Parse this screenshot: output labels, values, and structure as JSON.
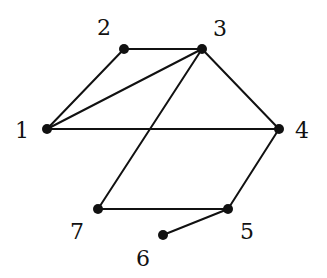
{
  "graph": {
    "nodes": [
      {
        "id": "1",
        "label": "1",
        "x": 47,
        "y": 129,
        "lx": 22,
        "ly": 138
      },
      {
        "id": "2",
        "label": "2",
        "x": 124,
        "y": 49,
        "lx": 104,
        "ly": 35
      },
      {
        "id": "3",
        "label": "3",
        "x": 202,
        "y": 49,
        "lx": 220,
        "ly": 36
      },
      {
        "id": "4",
        "label": "4",
        "x": 279,
        "y": 129,
        "lx": 302,
        "ly": 138
      },
      {
        "id": "5",
        "label": "5",
        "x": 228,
        "y": 209,
        "lx": 247,
        "ly": 239
      },
      {
        "id": "6",
        "label": "6",
        "x": 163,
        "y": 235,
        "lx": 143,
        "ly": 266
      },
      {
        "id": "7",
        "label": "7",
        "x": 98,
        "y": 209,
        "lx": 77,
        "ly": 239
      }
    ],
    "edges": [
      [
        "2",
        "3"
      ],
      [
        "1",
        "2"
      ],
      [
        "1",
        "3"
      ],
      [
        "3",
        "4"
      ],
      [
        "1",
        "4"
      ],
      [
        "3",
        "7"
      ],
      [
        "4",
        "5"
      ],
      [
        "7",
        "5"
      ],
      [
        "5",
        "6"
      ]
    ]
  }
}
